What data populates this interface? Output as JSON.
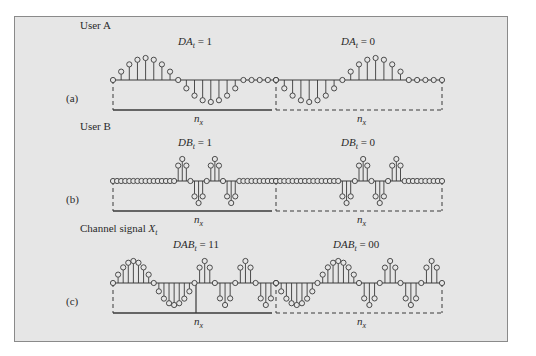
{
  "figure": {
    "background": "#e6e6e6",
    "border_color": "#8a8a8a",
    "stroke_color": "#3a3a3a",
    "panels": [
      {
        "id": "a",
        "panel_label": "(a)",
        "title": "User A",
        "left_eq": {
          "var": "DA",
          "sub": "t",
          "value": "= 1"
        },
        "right_eq": {
          "var": "DA",
          "sub": "t",
          "value": "= 0"
        },
        "span_label": {
          "var": "n",
          "sub": "x"
        },
        "baseline_y": 80,
        "amp": 22,
        "samples_left": [
          0,
          0.38,
          0.71,
          0.92,
          1,
          0.92,
          0.71,
          0.38,
          0,
          -0.38,
          -0.71,
          -0.92,
          -1,
          -0.92,
          -0.71,
          -0.38,
          0,
          0,
          0,
          0,
          0
        ],
        "samples_right": [
          0,
          -0.38,
          -0.71,
          -0.92,
          -1,
          -0.92,
          -0.71,
          -0.38,
          0,
          0.38,
          0.71,
          0.92,
          1,
          0.92,
          0.71,
          0.38,
          0,
          0,
          0,
          0,
          0
        ]
      },
      {
        "id": "b",
        "panel_label": "(b)",
        "title": "User B",
        "left_eq": {
          "var": "DB",
          "sub": "t",
          "value": "= 1"
        },
        "right_eq": {
          "var": "DB",
          "sub": "t",
          "value": "= 0"
        },
        "span_label": {
          "var": "n",
          "sub": "x"
        },
        "baseline_y": 181,
        "amp": 22,
        "samples_left": [
          0,
          0,
          0,
          0,
          0,
          0,
          0,
          0,
          0,
          0,
          0,
          0,
          0,
          0,
          0,
          0,
          0.7,
          1,
          0.7,
          0,
          -0.7,
          -1,
          -0.7,
          0,
          0.7,
          1,
          0.7,
          0,
          -0.7,
          -1,
          -0.7,
          0,
          0,
          0,
          0,
          0,
          0,
          0,
          0,
          0,
          0
        ],
        "samples_right": [
          0,
          0,
          0,
          0,
          0,
          0,
          0,
          0,
          0,
          0,
          0,
          0,
          0,
          0,
          0,
          0,
          -0.7,
          -1,
          -0.7,
          0,
          0.7,
          1,
          0.7,
          0,
          -0.7,
          -1,
          -0.7,
          0,
          0.7,
          1,
          0.7,
          0,
          0,
          0,
          0,
          0,
          0,
          0,
          0,
          0,
          0
        ]
      },
      {
        "id": "c",
        "panel_label": "(c)",
        "title": "Channel signal",
        "title_var": {
          "var": "X",
          "sub": "t"
        },
        "left_eq": {
          "var": "DAB",
          "sub": "t",
          "value": "= 11"
        },
        "right_eq": {
          "var": "DAB",
          "sub": "t",
          "value": "= 00"
        },
        "span_label": {
          "var": "n",
          "sub": "x"
        },
        "baseline_y": 283,
        "amp": 22,
        "samples_left": [
          0,
          0.38,
          0.71,
          0.92,
          1,
          0.92,
          0.71,
          0.38,
          0,
          -0.38,
          -0.71,
          -0.92,
          -1,
          -0.92,
          -0.71,
          -0.38,
          0,
          0.7,
          1,
          0.7,
          0,
          -0.7,
          -1,
          -0.7,
          0,
          0.7,
          1,
          0.7,
          0,
          -0.7,
          -1,
          -0.7,
          0
        ],
        "samples_right": [
          0,
          -0.38,
          -0.71,
          -0.92,
          -1,
          -0.92,
          -0.71,
          -0.38,
          0,
          0.38,
          0.71,
          0.92,
          1,
          0.92,
          0.71,
          0.38,
          0,
          -0.7,
          -1,
          -0.7,
          0,
          0.7,
          1,
          0.7,
          0,
          -0.7,
          -1,
          -0.7,
          0,
          0.7,
          1,
          0.7,
          0
        ],
        "divider_x": 196
      }
    ],
    "x_start": 113,
    "x_mid": 276,
    "x_end": 442
  }
}
